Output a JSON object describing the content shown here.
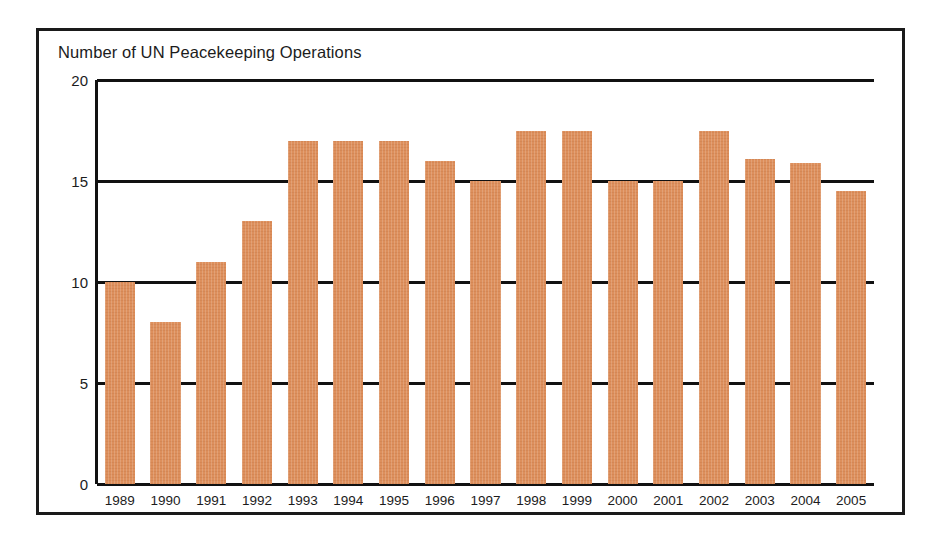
{
  "chart_data": {
    "type": "bar",
    "title": "Number of UN Peacekeeping Operations",
    "xlabel": "",
    "ylabel": "",
    "categories": [
      "1989",
      "1990",
      "1991",
      "1992",
      "1993",
      "1994",
      "1995",
      "1996",
      "1997",
      "1998",
      "1999",
      "2000",
      "2001",
      "2002",
      "2003",
      "2004",
      "2005"
    ],
    "values": [
      10,
      8,
      11,
      13,
      17,
      17,
      17,
      16,
      15,
      17.5,
      17.5,
      15,
      15,
      17.5,
      16.1,
      15.9,
      14.5
    ],
    "series": [
      {
        "name": "Number of UN Peacekeeping Operations",
        "values": [
          10,
          8,
          11,
          13,
          17,
          17,
          17,
          16,
          15,
          17.5,
          17.5,
          15,
          15,
          17.5,
          16.1,
          15.9,
          14.5
        ]
      }
    ],
    "ylim": [
      0,
      20
    ],
    "yticks": [
      0,
      5,
      10,
      15,
      20
    ],
    "ytick_labels": [
      "0",
      "5",
      "10",
      "15",
      "20"
    ],
    "grid": true,
    "grid_axis": "y",
    "legend": false,
    "legend_position": "none",
    "bar_color": "#dd8f5c",
    "axis_color": "#111111",
    "frame_color": "#1a1a1a",
    "background_color": "#ffffff",
    "annotations": []
  }
}
